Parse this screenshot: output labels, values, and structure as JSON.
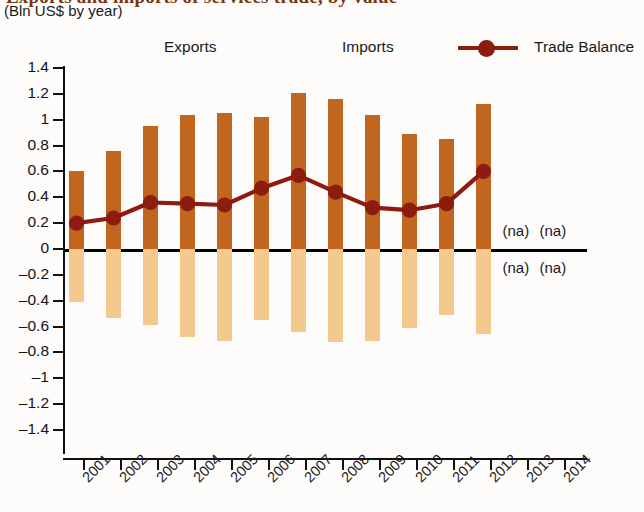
{
  "header": {
    "title_clipped": "Exports and imports of services trade, by value",
    "subtitle": "(Bln US$ by year)"
  },
  "legend": {
    "items": [
      {
        "label": "Exports",
        "marker": "square-swatch",
        "color": "#c0661f"
      },
      {
        "label": "Imports",
        "marker": "square-swatch",
        "color": "#f4c98d"
      },
      {
        "label": "Trade Balance",
        "marker": "line-with-dot",
        "color": "#8d1b10"
      }
    ]
  },
  "annotations": {
    "na_label": "(na)",
    "na_cells": [
      {
        "year": "2013",
        "position": "above-zero"
      },
      {
        "year": "2014",
        "position": "above-zero"
      },
      {
        "year": "2013",
        "position": "below-zero"
      },
      {
        "year": "2014",
        "position": "below-zero"
      }
    ]
  },
  "chart_data": {
    "type": "bar",
    "title": "Exports and imports of services trade, by value",
    "subtitle": "(Bln US$ by year)",
    "xlabel": "",
    "ylabel": "",
    "ylim": [
      -1.4,
      1.4
    ],
    "ytick_step": 0.2,
    "ytick_labels": [
      "1.4",
      "1.2",
      "1",
      "0.8",
      "0.6",
      "0.4",
      "0.2",
      "0",
      "–0.2",
      "–0.4",
      "–0.6",
      "–0.8",
      "–1",
      "–1.2",
      "–1.4"
    ],
    "ytick_values": [
      1.4,
      1.2,
      1.0,
      0.8,
      0.6,
      0.4,
      0.2,
      0,
      -0.2,
      -0.4,
      -0.6,
      -0.8,
      -1.0,
      -1.2,
      -1.4
    ],
    "grid": false,
    "legend_position": "top",
    "categories": [
      "2001",
      "2002",
      "2003",
      "2004",
      "2005",
      "2006",
      "2007",
      "2008",
      "2009",
      "2010",
      "2011",
      "2012",
      "2013",
      "2014"
    ],
    "series": [
      {
        "name": "Exports",
        "type": "bar",
        "color": "#c0661f",
        "values": [
          0.6,
          0.76,
          0.95,
          1.04,
          1.05,
          1.02,
          1.21,
          1.16,
          1.04,
          0.89,
          0.85,
          1.12,
          null,
          null
        ]
      },
      {
        "name": "Imports",
        "type": "bar",
        "color": "#f4c98d",
        "values": [
          -0.41,
          -0.53,
          -0.59,
          -0.68,
          -0.71,
          -0.55,
          -0.64,
          -0.72,
          -0.71,
          -0.61,
          -0.51,
          -0.66,
          null,
          null
        ]
      },
      {
        "name": "Trade Balance",
        "type": "line",
        "color": "#8d1b10",
        "values": [
          0.2,
          0.24,
          0.36,
          0.35,
          0.34,
          0.47,
          0.57,
          0.44,
          0.32,
          0.3,
          0.35,
          0.6,
          null,
          null
        ]
      }
    ]
  }
}
